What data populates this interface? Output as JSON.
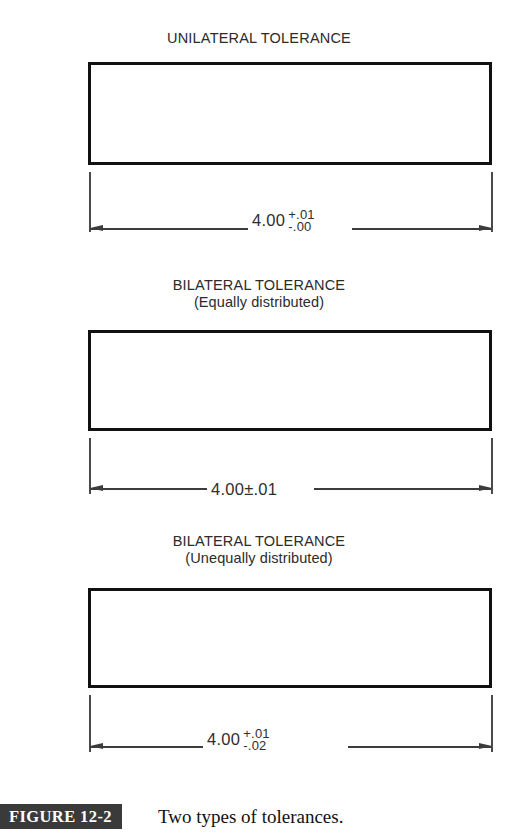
{
  "figure": {
    "badge_label": "FIGURE 12-2",
    "caption": "Two types of tolerances.",
    "badge_color": "#3a3a3a",
    "badge_text_color": "#ffffff",
    "line_color": "#111111"
  },
  "blocks": [
    {
      "title": "UNILATERAL TOLERANCE",
      "subtitle": "",
      "dimension": {
        "nominal": "4.00",
        "style": "stacked",
        "upper": "+.01",
        "lower": "-.00",
        "plus_minus": ""
      }
    },
    {
      "title": "BILATERAL TOLERANCE",
      "subtitle": "(Equally distributed)",
      "dimension": {
        "nominal": "4.00",
        "style": "plusminus",
        "upper": "",
        "lower": "",
        "plus_minus": "±.01"
      }
    },
    {
      "title": "BILATERAL TOLERANCE",
      "subtitle": "(Unequally distributed)",
      "dimension": {
        "nominal": "4.00",
        "style": "stacked",
        "upper": "+.01",
        "lower": "-.02",
        "plus_minus": ""
      }
    }
  ]
}
